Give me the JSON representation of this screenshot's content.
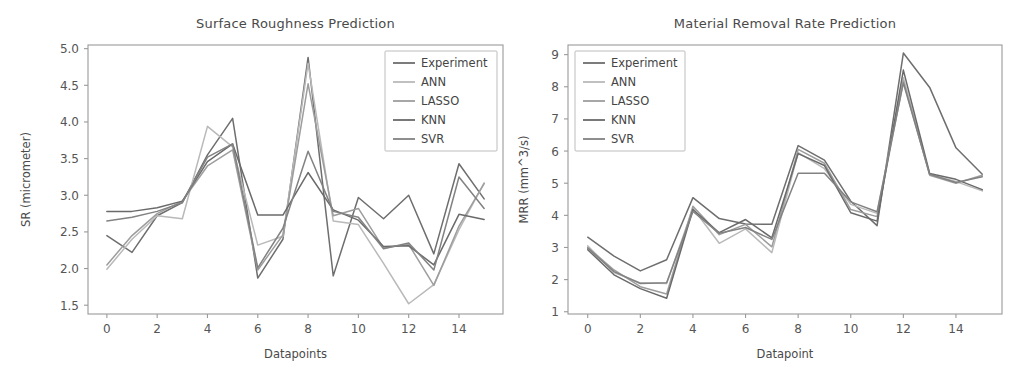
{
  "figure": {
    "background": "#ffffff",
    "panels": [
      "surface-roughness",
      "material-removal-rate"
    ]
  },
  "palette": {
    "experiment": "#6e6e6e",
    "ann": "#b9b9b9",
    "lasso": "#9d9d9d",
    "knn": "#6a6a6a",
    "svr": "#828282",
    "axis": "#9a9a9a",
    "text": "#4a4a4a"
  },
  "legend_labels": [
    "Experiment",
    "ANN",
    "LASSO",
    "KNN",
    "SVR"
  ],
  "chart_data": [
    {
      "id": "surface-roughness",
      "type": "line",
      "title": "Surface Roughness Prediction",
      "xlabel": "Datapoints",
      "ylabel": "SR (micrometer)",
      "grid": false,
      "legend_position": "upper right",
      "xlim": [
        -0.75,
        15.75
      ],
      "ylim": [
        1.38,
        5.05
      ],
      "xticks": [
        0,
        2,
        4,
        6,
        8,
        10,
        12,
        14
      ],
      "yticks": [
        1.5,
        2.0,
        2.5,
        3.0,
        3.5,
        4.0,
        4.5,
        5.0
      ],
      "xticklabels": [
        "0",
        "2",
        "4",
        "6",
        "8",
        "10",
        "12",
        "14"
      ],
      "yticklabels": [
        "1.5",
        "2.0",
        "2.5",
        "3.0",
        "3.5",
        "4.0",
        "4.5",
        "5.0"
      ],
      "x": [
        0,
        1,
        2,
        3,
        4,
        5,
        6,
        7,
        8,
        9,
        10,
        11,
        12,
        13,
        14,
        15
      ],
      "series": [
        {
          "name": "Experiment",
          "color": "#6e6e6e",
          "values": [
            2.45,
            2.22,
            2.72,
            2.9,
            3.55,
            4.05,
            1.87,
            2.4,
            4.88,
            1.9,
            2.97,
            2.68,
            3.0,
            2.2,
            3.43,
            2.95
          ]
        },
        {
          "name": "ANN",
          "color": "#b9b9b9",
          "values": [
            1.99,
            2.4,
            2.72,
            2.68,
            3.94,
            3.66,
            2.32,
            2.44,
            4.8,
            2.65,
            2.6,
            2.07,
            1.52,
            1.78,
            2.53,
            3.17
          ]
        },
        {
          "name": "LASSO",
          "color": "#9d9d9d",
          "values": [
            2.05,
            2.45,
            2.75,
            2.92,
            3.4,
            3.62,
            1.98,
            2.46,
            4.52,
            2.72,
            2.82,
            2.28,
            2.33,
            1.77,
            2.58,
            3.16
          ]
        },
        {
          "name": "KNN",
          "color": "#6a6a6a",
          "values": [
            2.78,
            2.78,
            2.83,
            2.92,
            3.46,
            3.7,
            2.73,
            2.73,
            3.31,
            2.8,
            2.66,
            2.3,
            2.31,
            2.05,
            2.74,
            2.67
          ]
        },
        {
          "name": "SVR",
          "color": "#828282",
          "values": [
            2.65,
            2.7,
            2.78,
            2.9,
            3.52,
            3.7,
            2.01,
            2.55,
            3.6,
            2.78,
            2.7,
            2.27,
            2.35,
            1.98,
            3.25,
            2.82
          ]
        }
      ]
    },
    {
      "id": "material-removal-rate",
      "type": "line",
      "title": "Material Removal Rate Prediction",
      "xlabel": "Datapoint",
      "ylabel": "MRR (mm^3/s)",
      "grid": false,
      "legend_position": "upper left",
      "xlim": [
        -0.75,
        15.75
      ],
      "ylim": [
        0.93,
        9.3
      ],
      "xticks": [
        0,
        2,
        4,
        6,
        8,
        10,
        12,
        14
      ],
      "yticks": [
        1,
        2,
        3,
        4,
        5,
        6,
        7,
        8,
        9
      ],
      "xticklabels": [
        "0",
        "2",
        "4",
        "6",
        "8",
        "10",
        "12",
        "14"
      ],
      "yticklabels": [
        "1",
        "2",
        "3",
        "4",
        "5",
        "6",
        "7",
        "8",
        "9"
      ],
      "x": [
        0,
        1,
        2,
        3,
        4,
        5,
        6,
        7,
        8,
        9,
        10,
        11,
        12,
        13,
        14,
        15
      ],
      "series": [
        {
          "name": "Experiment",
          "color": "#6e6e6e",
          "values": [
            3.32,
            2.73,
            2.27,
            2.62,
            4.55,
            3.9,
            3.73,
            3.72,
            6.17,
            5.72,
            4.44,
            3.68,
            9.05,
            7.98,
            6.1,
            5.28
          ]
        },
        {
          "name": "ANN",
          "color": "#b9b9b9",
          "values": [
            3.05,
            2.22,
            1.9,
            1.88,
            4.22,
            3.13,
            3.58,
            2.84,
            5.95,
            5.45,
            4.34,
            4.06,
            8.28,
            5.27,
            5.05,
            4.76
          ]
        },
        {
          "name": "LASSO",
          "color": "#9d9d9d",
          "values": [
            3.0,
            2.3,
            1.78,
            1.55,
            4.28,
            3.4,
            3.72,
            3.02,
            6.05,
            5.62,
            4.18,
            3.96,
            8.18,
            5.25,
            5.0,
            5.25
          ]
        },
        {
          "name": "KNN",
          "color": "#6a6a6a",
          "values": [
            2.93,
            2.15,
            1.72,
            1.42,
            4.18,
            3.46,
            3.87,
            3.3,
            5.92,
            5.55,
            4.08,
            3.82,
            8.52,
            5.3,
            5.12,
            4.8
          ]
        },
        {
          "name": "SVR",
          "color": "#828282",
          "values": [
            2.98,
            2.25,
            1.88,
            1.9,
            4.12,
            3.44,
            3.62,
            3.25,
            5.31,
            5.31,
            4.42,
            4.11,
            8.12,
            5.28,
            5.02,
            5.2
          ]
        }
      ]
    }
  ]
}
